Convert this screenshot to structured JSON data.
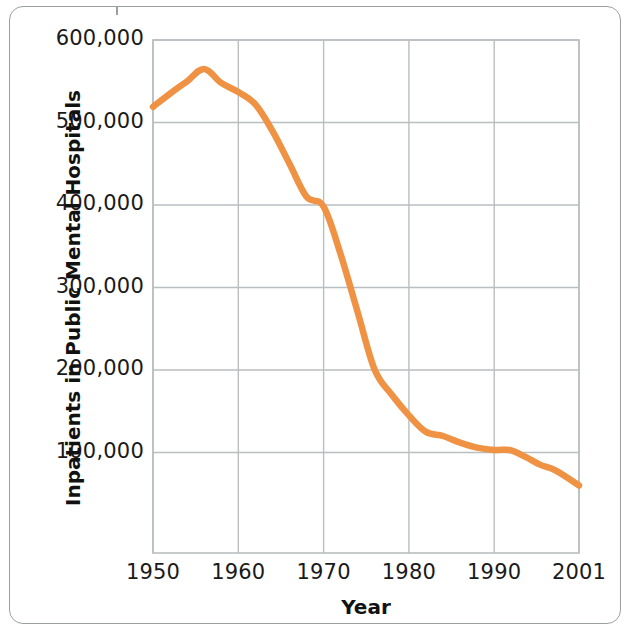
{
  "figure": {
    "frame_color": "#9aa0a2",
    "background": "#ffffff"
  },
  "chart_data": {
    "type": "line",
    "title": "",
    "subtitle": "",
    "xlabel": "Year",
    "ylabel": "Inpatients in Public Mental Hospitals",
    "line_color": "#ef9243",
    "grid_color": "#b9bec0",
    "grid": true,
    "legend": null,
    "legend_position": "none",
    "xlim": [
      1950,
      2001
    ],
    "ylim": [
      0,
      600000
    ],
    "x_tick_labels": [
      "1950",
      "1960",
      "1970",
      "1980",
      "1990",
      "2001"
    ],
    "x_ticks": [
      1950,
      1960,
      1970,
      1980,
      1990,
      2001
    ],
    "y_tick_labels": [
      "600,000",
      "500,000",
      "400,000",
      "300,000",
      "200,000",
      "100,000"
    ],
    "y_ticks": [
      600000,
      500000,
      400000,
      300000,
      200000,
      100000
    ],
    "series": [
      {
        "name": "Inpatients in Public Mental Hospitals",
        "color": "#ef9243",
        "x": [
          1950,
          1952,
          1954,
          1956,
          1958,
          1960,
          1962,
          1964,
          1966,
          1968,
          1970,
          1972,
          1974,
          1976,
          1978,
          1980,
          1982,
          1984,
          1986,
          1988,
          1990,
          1992,
          1994,
          1996,
          1998,
          2001
        ],
        "values": [
          519000,
          535000,
          550000,
          565000,
          548000,
          537000,
          522000,
          490000,
          450000,
          410000,
          398000,
          340000,
          270000,
          200000,
          170000,
          145000,
          125000,
          120000,
          112000,
          106000,
          103000,
          103000,
          95000,
          85000,
          78000,
          60000
        ]
      }
    ]
  }
}
